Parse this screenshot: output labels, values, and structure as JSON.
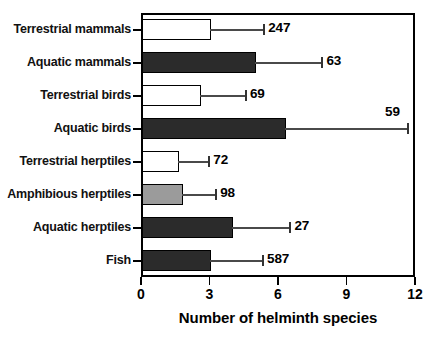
{
  "chart_data": {
    "type": "bar",
    "orientation": "horizontal",
    "title": "",
    "xlabel": "Number of helminth species",
    "ylabel": "",
    "xlim": [
      0,
      12
    ],
    "xticks": [
      0,
      3,
      6,
      9,
      12
    ],
    "xtick_labels": [
      "0",
      "3",
      "6",
      "9",
      "12"
    ],
    "grid": false,
    "legend": null,
    "categories": [
      "Terrestrial mammals",
      "Aquatic mammals",
      "Terrestrial birds",
      "Aquatic birds",
      "Terrestrial herptiles",
      "Amphibious herptiles",
      "Aquatic herptiles",
      "Fish"
    ],
    "values": [
      3.0,
      5.0,
      2.6,
      6.3,
      1.6,
      1.8,
      4.0,
      3.0
    ],
    "error_upper": [
      5.35,
      7.9,
      4.55,
      11.65,
      2.95,
      3.25,
      6.5,
      5.3
    ],
    "annotations": [
      "247",
      "63",
      "69",
      "59",
      "72",
      "98",
      "27",
      "587"
    ],
    "annotation_meaning": "sample size (n) of host species per group",
    "bar_styles": [
      "white",
      "black",
      "white",
      "black",
      "white",
      "gray",
      "black",
      "black"
    ],
    "colors": {
      "white": "#ffffff",
      "black": "#2b2b2b",
      "gray": "#9b9b9b",
      "outline": "#000000",
      "error": "#4a4a4a"
    },
    "rows": [
      {
        "label": "Terrestrial mammals",
        "value": 3.0,
        "error_upper": 5.35,
        "n": "247",
        "style": "white",
        "label_above": false
      },
      {
        "label": "Aquatic mammals",
        "value": 5.0,
        "error_upper": 7.9,
        "n": "63",
        "style": "black",
        "label_above": false
      },
      {
        "label": "Terrestrial birds",
        "value": 2.6,
        "error_upper": 4.55,
        "n": "69",
        "style": "white",
        "label_above": false
      },
      {
        "label": "Aquatic birds",
        "value": 6.3,
        "error_upper": 11.65,
        "n": "59",
        "style": "black",
        "label_above": true
      },
      {
        "label": "Terrestrial herptiles",
        "value": 1.6,
        "error_upper": 2.95,
        "n": "72",
        "style": "white",
        "label_above": false
      },
      {
        "label": "Amphibious herptiles",
        "value": 1.8,
        "error_upper": 3.25,
        "n": "98",
        "style": "gray",
        "label_above": false
      },
      {
        "label": "Aquatic herptiles",
        "value": 4.0,
        "error_upper": 6.5,
        "n": "27",
        "style": "black",
        "label_above": false
      },
      {
        "label": "Fish",
        "value": 3.0,
        "error_upper": 5.3,
        "n": "587",
        "style": "black",
        "label_above": false
      }
    ]
  }
}
